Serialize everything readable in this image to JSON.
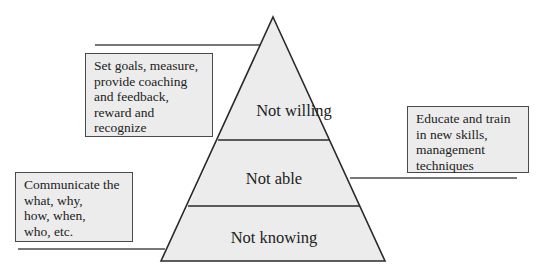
{
  "pyramid": {
    "fill_color": "#ececec",
    "stroke_color": "#2a2a2a",
    "tiers": [
      {
        "label": "Not willing",
        "position": "top"
      },
      {
        "label": "Not able",
        "position": "middle"
      },
      {
        "label": "Not knowing",
        "position": "bottom"
      }
    ]
  },
  "callouts": [
    {
      "target_tier": "Not willing",
      "side": "left",
      "lines": [
        "Set goals, measure,",
        "provide coaching",
        "and feedback,",
        "reward and",
        "recognize"
      ]
    },
    {
      "target_tier": "Not able",
      "side": "right",
      "lines": [
        "Educate and train",
        "in new skills,",
        "management",
        "techniques"
      ]
    },
    {
      "target_tier": "Not knowing",
      "side": "left",
      "lines": [
        "Communicate the",
        "what, why,",
        "how, when,",
        "who, etc."
      ]
    }
  ]
}
